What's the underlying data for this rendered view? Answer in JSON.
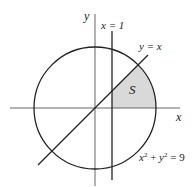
{
  "figure": {
    "type": "region-diagram",
    "colors": {
      "stroke": "#222222",
      "axis": "#555555",
      "shade": "#d9d9d9",
      "background": "#ffffff"
    }
  },
  "labels": {
    "y_axis": "y",
    "x_axis": "x",
    "vertical_line": "x = 1",
    "diagonal_line": "y = x",
    "region": "S",
    "circle_eq_x": "x",
    "circle_eq_plus": " + ",
    "circle_eq_y": "y",
    "circle_eq_tail": " = 9",
    "exp": "2"
  },
  "geometry": {
    "center": [
      95,
      108
    ],
    "radius": 61,
    "vertical_line_x": 112,
    "circle": "x^2 + y^2 = 9",
    "line_vertical": "x = 1",
    "line_diagonal": "y = x"
  }
}
